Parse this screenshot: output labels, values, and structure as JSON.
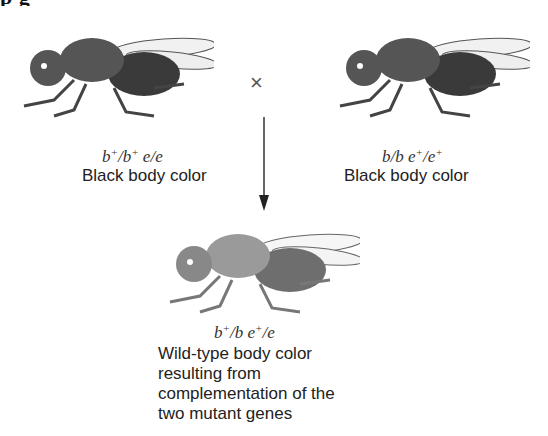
{
  "heading": {
    "text": "p          g",
    "note": "clipped at top edge"
  },
  "parents": [
    {
      "genotype": {
        "b1": "b",
        "b1_sup": "+",
        "b2": "/b",
        "b2_sup": "+",
        "e": " e/e",
        "e_sup1": "",
        "e2": ""
      },
      "genotype_text": "b+/b+ e/e",
      "phenotype": "Black body color",
      "body_color": "#4a4a4a"
    },
    {
      "genotype_text": "b/b e+/e+",
      "phenotype": "Black body color",
      "body_color": "#4a4a4a"
    }
  ],
  "cross_symbol": "×",
  "offspring": {
    "genotype_text": "b+/b e+/e",
    "phenotype_lines": [
      "Wild-type body color",
      "resulting from",
      "complementation of the",
      "two mutant genes"
    ],
    "body_color": "#8a8a8a"
  },
  "colors": {
    "arrow": "#333333",
    "text": "#222222"
  }
}
